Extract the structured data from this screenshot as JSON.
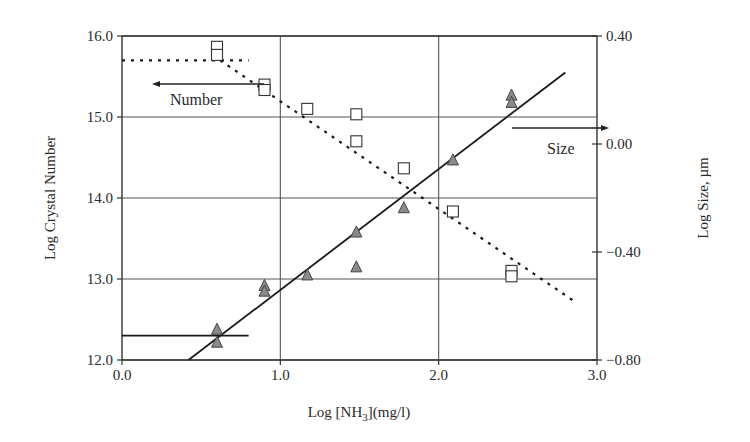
{
  "chart_data": {
    "type": "scatter",
    "title": "",
    "xlabel": "Log [NH3](mg/l)",
    "xlabel_parts": {
      "pre": "Log [NH",
      "sub": "3",
      "post": "](mg/l)"
    },
    "ylabel": "Log Crystal Number",
    "y2label": "Log Size, µm",
    "xlim": [
      0.0,
      3.0
    ],
    "ylim": [
      12.0,
      16.0
    ],
    "y2lim": [
      -0.8,
      0.4
    ],
    "x_ticks": [
      "0.0",
      "1.0",
      "2.0",
      "3.0"
    ],
    "y_ticks": [
      "12.0",
      "13.0",
      "14.0",
      "15.0",
      "16.0"
    ],
    "y2_ticks": [
      "−0.80",
      "−0.40",
      "0.00",
      "0.40"
    ],
    "grid": true,
    "series": [
      {
        "name": "Number",
        "axis": "left",
        "marker": "triangle",
        "marker_color": "#8a8a8a",
        "points": [
          [
            0.6,
            12.38
          ],
          [
            0.6,
            12.22
          ],
          [
            0.9,
            12.92
          ],
          [
            0.9,
            12.85
          ],
          [
            1.17,
            13.05
          ],
          [
            1.48,
            13.58
          ],
          [
            1.48,
            13.15
          ],
          [
            1.78,
            13.88
          ],
          [
            2.09,
            14.47
          ],
          [
            2.46,
            15.27
          ],
          [
            2.46,
            15.18
          ]
        ]
      },
      {
        "name": "Size",
        "axis": "right",
        "marker": "square",
        "marker_color": "#ffffff",
        "points": [
          [
            0.6,
            0.36
          ],
          [
            0.6,
            0.33
          ],
          [
            0.9,
            0.22
          ],
          [
            0.9,
            0.2
          ],
          [
            1.17,
            0.13
          ],
          [
            1.48,
            0.11
          ],
          [
            1.48,
            0.01
          ],
          [
            1.78,
            -0.09
          ],
          [
            2.09,
            -0.25
          ],
          [
            2.46,
            -0.47
          ],
          [
            2.46,
            -0.49
          ]
        ]
      }
    ],
    "fit_lines": [
      {
        "name": "Number fit",
        "style": "solid",
        "axis": "left",
        "from": [
          0.42,
          12.0
        ],
        "to": [
          2.8,
          15.55
        ]
      },
      {
        "name": "Number plateau",
        "style": "solid",
        "axis": "left",
        "from": [
          0.0,
          12.3
        ],
        "to": [
          0.8,
          12.3
        ]
      },
      {
        "name": "Size fit",
        "style": "dotted",
        "axis": "right",
        "from": [
          0.62,
          0.31
        ],
        "to": [
          2.85,
          -0.58
        ]
      },
      {
        "name": "Size plateau",
        "style": "dotted",
        "axis": "right",
        "from": [
          0.0,
          0.31
        ],
        "to": [
          0.8,
          0.31
        ]
      }
    ],
    "annotations": [
      {
        "text": "Number",
        "arrow": "left",
        "points_to_axis": "left"
      },
      {
        "text": "Size",
        "arrow": "right",
        "points_to_axis": "right"
      }
    ],
    "legend": "none"
  },
  "labels": {
    "ylabel": "Log Crystal Number",
    "y2label": "Log Size, µm",
    "x_pre": "Log [NH",
    "x_sub": "3",
    "x_post": "](mg/l)",
    "number_annot": "Number",
    "size_annot": "Size"
  }
}
